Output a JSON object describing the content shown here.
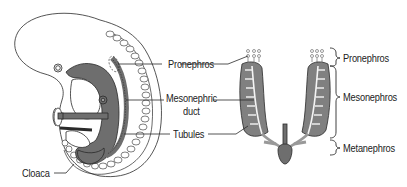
{
  "diagram": {
    "type": "anatomical illustration",
    "left_panel": {
      "labels": {
        "pronephros": "Pronephros",
        "mesonephric_duct_line1": "Mesonephric",
        "mesonephric_duct_line2": "duct",
        "tubules": "Tubules",
        "cloaca": "Cloaca"
      }
    },
    "right_panel": {
      "labels": {
        "pronephros": "Pronephros",
        "mesonephros": "Mesonephros",
        "metanephros": "Metanephros"
      }
    },
    "colors": {
      "outline": "#2a2a2a",
      "tissue_dark": "#6e6e6e",
      "tissue_mid": "#8a8a8a",
      "somite_fill": "#ffffff",
      "background": "#ffffff"
    }
  }
}
